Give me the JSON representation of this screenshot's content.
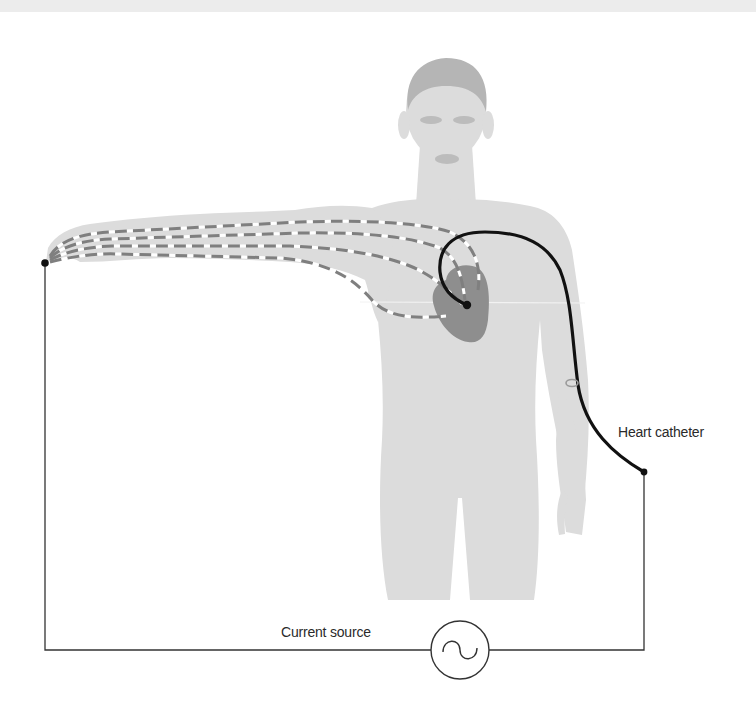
{
  "figure": {
    "type": "anatomical-circuit-diagram",
    "colors": {
      "background": "#ffffff",
      "top_band": "#ececec",
      "body_silhouette": "#dcdcdc",
      "hair": "#b5b5b5",
      "facial_features": "#bcbcbc",
      "heart": "#8e8e8e",
      "current_paths_dash": "#7f7f7f",
      "current_paths_gap": "#ffffff",
      "catheter": "#111111",
      "wire": "#333333",
      "catheter_entry_ring": "#9a9a9a"
    },
    "labels": {
      "catheter": "Heart catheter",
      "source": "Current source"
    },
    "icons": {
      "source_symbol": "ac-source-sine-wave-icon"
    },
    "elements": [
      "human body silhouette with arm extended left",
      "heart (dark gray) in chest",
      "four dashed current paths from hand to heart",
      "heart catheter (black) entering at right arm elbow, looping into heart",
      "wire from left hand electrode down to current source",
      "wire from catheter end down to current source",
      "AC current source circle symbol with sine wave"
    ]
  }
}
